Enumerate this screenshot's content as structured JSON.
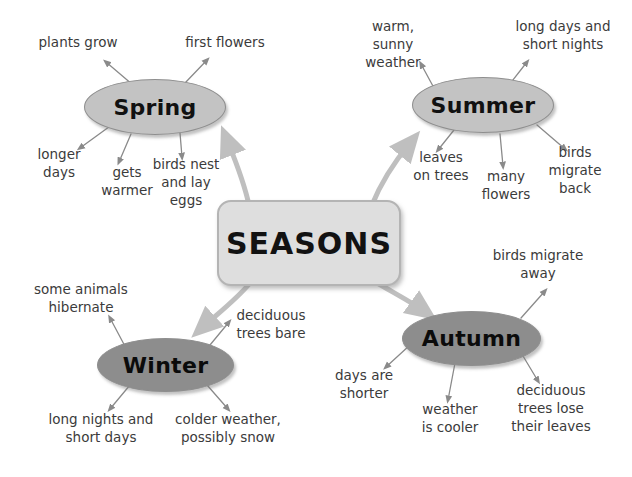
{
  "diagram": {
    "title": "SEASONS",
    "type": "mind-map",
    "colors": {
      "background": "#ffffff",
      "center_fill": "#dedede",
      "center_border": "#b4b4b4",
      "light_ellipse_fill": "#c3c3c3",
      "dark_ellipse_fill": "#8d8d8d",
      "ellipse_border": "#8e8e8e",
      "connector_gray": "#b8b8b8",
      "leaf_connector": "#8a8a8a",
      "text": "#3b3b3b"
    }
  },
  "center": {
    "label": "SEASONS"
  },
  "branches": [
    {
      "id": "spring",
      "label": "Spring",
      "shade": "light",
      "leaves": [
        {
          "id": "plants-grow",
          "text": "plants grow"
        },
        {
          "id": "first-flowers",
          "text": "first flowers"
        },
        {
          "id": "longer-days",
          "text": "longer\ndays"
        },
        {
          "id": "gets-warmer",
          "text": "gets\nwarmer"
        },
        {
          "id": "birds-nest",
          "text": "birds nest\nand lay\neggs"
        }
      ]
    },
    {
      "id": "summer",
      "label": "Summer",
      "shade": "light",
      "leaves": [
        {
          "id": "warm-sunny-weather",
          "text": "warm,\nsunny\nweather"
        },
        {
          "id": "long-days-short-nights",
          "text": "long days and\nshort nights"
        },
        {
          "id": "leaves-on-trees",
          "text": "leaves\non trees"
        },
        {
          "id": "many-flowers",
          "text": "many\nflowers"
        },
        {
          "id": "birds-migrate-back",
          "text": "birds\nmigrate\nback"
        }
      ]
    },
    {
      "id": "autumn",
      "label": "Autumn",
      "shade": "dark",
      "leaves": [
        {
          "id": "birds-migrate-away",
          "text": "birds migrate\naway"
        },
        {
          "id": "days-are-shorter",
          "text": "days are\nshorter"
        },
        {
          "id": "weather-is-cooler",
          "text": "weather\nis cooler"
        },
        {
          "id": "deciduous-trees-lose-leaves",
          "text": "deciduous\ntrees lose\ntheir leaves"
        }
      ]
    },
    {
      "id": "winter",
      "label": "Winter",
      "shade": "dark",
      "leaves": [
        {
          "id": "some-animals-hibernate",
          "text": "some animals\nhibernate"
        },
        {
          "id": "deciduous-trees-bare",
          "text": "deciduous\ntrees bare"
        },
        {
          "id": "long-nights-short-days",
          "text": "long nights and\nshort days"
        },
        {
          "id": "colder-weather-snow",
          "text": "colder weather,\npossibly snow"
        }
      ]
    }
  ]
}
